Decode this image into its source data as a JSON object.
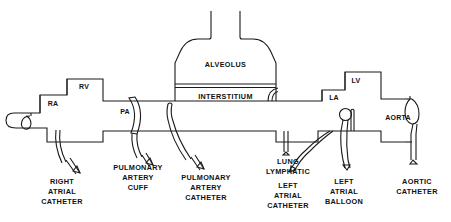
{
  "figure": {
    "background_color": "#ffffff",
    "line_color": "#1a1a1a"
  },
  "anatomy": {
    "alveolus": "ALVEOLUS",
    "interstitium": "INTERSTITIUM",
    "right_atrium": "RA",
    "right_ventricle": "RV",
    "pulmonary_artery": "PA",
    "left_atrium": "LA",
    "left_ventricle": "LV",
    "aorta": "AORTA"
  },
  "instruments": [
    {
      "id": "right-atrial-catheter",
      "lines": [
        "RIGHT",
        "ATRIAL",
        "CATHETER"
      ],
      "label_x": 62,
      "label_y": 184
    },
    {
      "id": "pulmonary-artery-cuff",
      "lines": [
        "PULMONARY",
        "ARTERY",
        "CUFF"
      ],
      "label_x": 138,
      "label_y": 170
    },
    {
      "id": "pulmonary-artery-catheter",
      "lines": [
        "PULMONARY",
        "ARTERY",
        "CATHETER"
      ],
      "label_x": 206,
      "label_y": 180
    },
    {
      "id": "lung-lymphatic",
      "lines": [
        "LUNG",
        "LYMPHATIC"
      ],
      "label_x": 288,
      "label_y": 164
    },
    {
      "id": "left-atrial-catheter",
      "lines": [
        "LEFT",
        "ATRIAL",
        "CATHETER"
      ],
      "label_x": 288,
      "label_y": 188
    },
    {
      "id": "left-atrial-balloon",
      "lines": [
        "LEFT",
        "ATRIAL",
        "BALLOON"
      ],
      "label_x": 344,
      "label_y": 184
    },
    {
      "id": "aortic-catheter",
      "lines": [
        "AORTIC",
        "CATHETER"
      ],
      "label_x": 417,
      "label_y": 184
    }
  ]
}
